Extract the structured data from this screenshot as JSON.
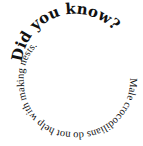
{
  "spiral": {
    "heading": "Did you know?",
    "body": "Male crocodilians do not help with making nests.",
    "text_color": "#111111",
    "background": "#ffffff"
  }
}
